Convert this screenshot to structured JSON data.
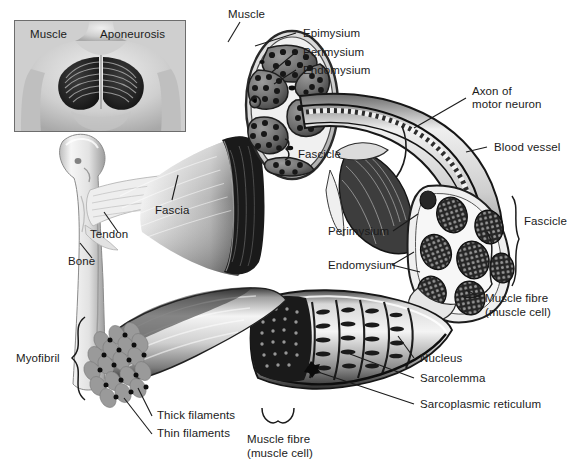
{
  "figure": {
    "palette": {
      "background": "#ffffff",
      "text": "#1b1b1b",
      "line": "#1b1b1b",
      "inset_border": "#6d6d6d",
      "tissue_light": "#e8e8e8",
      "tissue_mid": "#9a9a9a",
      "tissue_dark": "#2a2a2a",
      "fiber_dark": "#1f1f1f",
      "myofibril_grey": "#8f8f8f"
    }
  },
  "inset": {
    "name": "pectoral-muscle-inset",
    "labels": [
      {
        "id": "muscle",
        "text": "Muscle"
      },
      {
        "id": "aponeurosis",
        "text": "Aponeurosis"
      }
    ]
  },
  "labels": [
    {
      "id": "muscle-top",
      "text": "Muscle"
    },
    {
      "id": "epimysium",
      "text": "Epimysium"
    },
    {
      "id": "perimysium-top",
      "text": "Perimysium"
    },
    {
      "id": "endomysium-top",
      "text": "Endomysium"
    },
    {
      "id": "axon-of-motor-neuron",
      "text": "Axon of\nmotor neuron"
    },
    {
      "id": "blood-vessel",
      "text": "Blood vessel"
    },
    {
      "id": "fascicle-left",
      "text": "Fascicle"
    },
    {
      "id": "fascicle-right",
      "text": "Fascicle"
    },
    {
      "id": "fascia",
      "text": "Fascia"
    },
    {
      "id": "tendon",
      "text": "Tendon"
    },
    {
      "id": "bone",
      "text": "Bone"
    },
    {
      "id": "perimysium-mid",
      "text": "Perimysium"
    },
    {
      "id": "endomysium-mid",
      "text": "Endomysium"
    },
    {
      "id": "muscle-fibre-right",
      "text": "Muscle fibre\n(muscle cell)"
    },
    {
      "id": "nucleus",
      "text": "Nucleus"
    },
    {
      "id": "sarcolemma",
      "text": "Sarcolemma"
    },
    {
      "id": "sarcoplasmic-reticulum",
      "text": "Sarcoplasmic reticulum"
    },
    {
      "id": "myofibril",
      "text": "Myofibril"
    },
    {
      "id": "thick-filaments",
      "text": "Thick filaments"
    },
    {
      "id": "thin-filaments",
      "text": "Thin filaments"
    },
    {
      "id": "muscle-fibre-bottom",
      "text": "Muscle fibre\n(muscle cell)"
    }
  ],
  "label_text": {
    "muscle_top": "Muscle",
    "epimysium": "Epimysium",
    "perimysium_top": "Perimysium",
    "endomysium_top": "Endomysium",
    "axon_line1": "Axon of",
    "axon_line2": "motor neuron",
    "blood_vessel": "Blood vessel",
    "fascicle_left": "Fascicle",
    "fascicle_right": "Fascicle",
    "fascia": "Fascia",
    "tendon": "Tendon",
    "bone": "Bone",
    "perimysium_mid": "Perimysium",
    "endomysium_mid": "Endomysium",
    "muscle_fibre_r1": "Muscle fibre",
    "muscle_fibre_r2": "(muscle cell)",
    "nucleus": "Nucleus",
    "sarcolemma": "Sarcolemma",
    "sarcoplasmic_reticulum": "Sarcoplasmic reticulum",
    "myofibril": "Myofibril",
    "thick_filaments": "Thick filaments",
    "thin_filaments": "Thin filaments",
    "muscle_fibre_b1": "Muscle fibre",
    "muscle_fibre_b2": "(muscle cell)",
    "inset_muscle": "Muscle",
    "inset_aponeurosis": "Aponeurosis"
  }
}
